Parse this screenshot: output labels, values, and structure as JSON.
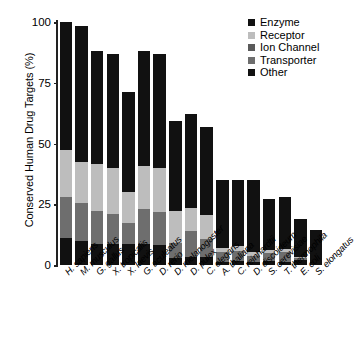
{
  "chart_data": {
    "type": "bar",
    "subtype": "stacked-bar",
    "title": "",
    "xlabel": "",
    "ylabel": "Conserved Human Drug Targets (%)",
    "ylim": [
      0,
      100
    ],
    "yticks": [
      0,
      25,
      50,
      75,
      100
    ],
    "ytick_labels": [
      "0",
      "25",
      "50",
      "75",
      "100"
    ],
    "grid": false,
    "legend_position": "top-right",
    "stack_order_bottom_to_top": [
      "Other",
      "Transporter",
      "Ion Channel",
      "Receptor",
      "Enzyme"
    ],
    "categories": [
      "H. sapiens",
      "M. musculus",
      "G. gallus",
      "X. tropicalis",
      "X. laevis",
      "G. aculeatus",
      "D. rerio",
      "D. melanogaster",
      "D. pulex",
      "C. elegans",
      "A. thaliana",
      "C. reinhardtii",
      "D. discoideum",
      "S. cerevisiae",
      "T. thermophila",
      "E. coli",
      "S. elongatus"
    ],
    "series": [
      {
        "name": "Other",
        "color": "#111111",
        "values": [
          11.0,
          10.0,
          8.7,
          8.5,
          8.5,
          8.7,
          8.2,
          3.0,
          3.4,
          3.4,
          1.3,
          1.6,
          1.3,
          1.6,
          1.3,
          2.2,
          0.0
        ]
      },
      {
        "name": "Transporter",
        "color": "#6e6e6e",
        "values": [
          16.8,
          15.6,
          13.5,
          12.5,
          9.0,
          14.5,
          13.8,
          6.0,
          10.5,
          7.5,
          4.2,
          4.2,
          2.5,
          3.4,
          4.2,
          0.5,
          0.0
        ]
      },
      {
        "name": "Ion Channel",
        "color": "#5a5a5a",
        "values": [
          0.0,
          0.0,
          0.0,
          0.0,
          0.0,
          0.0,
          0.0,
          0.0,
          0.0,
          0.0,
          0.0,
          0.0,
          0.0,
          0.0,
          0.0,
          0.0,
          0.0
        ]
      },
      {
        "name": "Receptor",
        "color": "#bdbdbd",
        "values": [
          19.5,
          17.0,
          19.5,
          19.0,
          12.4,
          17.5,
          17.8,
          13.2,
          9.6,
          9.8,
          1.5,
          2.1,
          1.5,
          1.1,
          1.0,
          0.7,
          0.0
        ]
      },
      {
        "name": "Enzyme",
        "color": "#111111",
        "values": [
          52.7,
          55.6,
          46.3,
          46.8,
          41.3,
          47.5,
          47.2,
          37.0,
          38.5,
          36.3,
          28.0,
          27.1,
          29.7,
          21.0,
          21.5,
          15.6,
          14.5
        ]
      }
    ],
    "totals": [
      100.0,
      98.2,
      88.0,
      86.8,
      71.2,
      88.2,
      87.0,
      59.2,
      62.0,
      57.0,
      35.0,
      35.0,
      35.0,
      27.1,
      28.0,
      19.0,
      14.5
    ]
  },
  "legend": {
    "items": [
      {
        "label": "Enzyme",
        "color": "#111111"
      },
      {
        "label": "Receptor",
        "color": "#bdbdbd"
      },
      {
        "label": "Ion Channel",
        "color": "#5a5a5a"
      },
      {
        "label": "Transporter",
        "color": "#6e6e6e"
      },
      {
        "label": "Other",
        "color": "#111111"
      }
    ]
  }
}
